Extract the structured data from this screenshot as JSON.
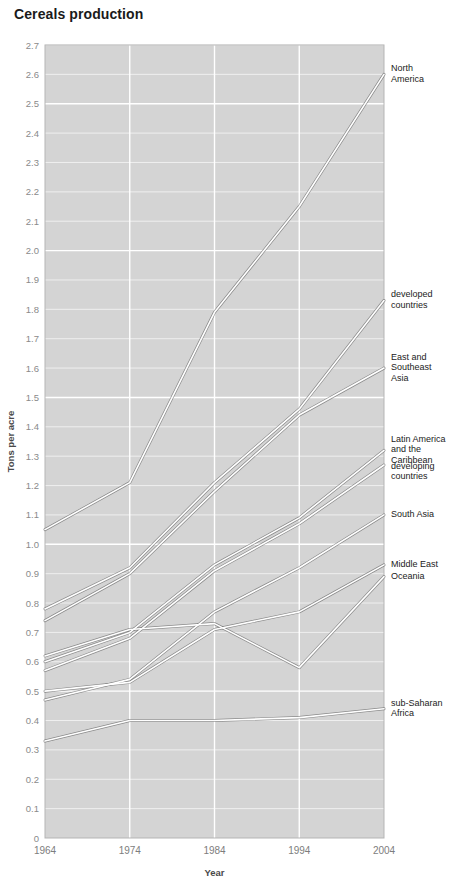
{
  "title": "Cereals production",
  "chart_data": {
    "type": "line",
    "title": "Cereals production",
    "xlabel": "Year",
    "ylabel": "Tons per acre",
    "x": [
      1964,
      1974,
      1984,
      1994,
      2004
    ],
    "xtick_labels": [
      "1964",
      "1974",
      "1984",
      "1994",
      "2004"
    ],
    "ylim": [
      0,
      2.7
    ],
    "ytick_labels": [
      "0",
      "0.1",
      "0.2",
      "0.3",
      "0.4",
      "0.5",
      "0.6",
      "0.7",
      "0.8",
      "0.9",
      "1.0",
      "1.1",
      "1.2",
      "1.3",
      "1.4",
      "1.5",
      "1.6",
      "1.7",
      "1.8",
      "1.9",
      "2.0",
      "2.1",
      "2.2",
      "2.3",
      "2.4",
      "2.5",
      "2.6",
      "2.7"
    ],
    "ytick_values": [
      0,
      0.1,
      0.2,
      0.3,
      0.4,
      0.5,
      0.6,
      0.7,
      0.8,
      0.9,
      1.0,
      1.1,
      1.2,
      1.3,
      1.4,
      1.5,
      1.6,
      1.7,
      1.8,
      1.9,
      2.0,
      2.1,
      2.2,
      2.3,
      2.4,
      2.5,
      2.6,
      2.7
    ],
    "grid": true,
    "legend_position": "right-inline-labels",
    "series": [
      {
        "name": "North America",
        "label": "North America",
        "values": [
          1.05,
          1.21,
          1.79,
          2.15,
          2.6
        ]
      },
      {
        "name": "developed countries",
        "label": "developed countries",
        "values": [
          0.78,
          0.92,
          1.21,
          1.46,
          1.83
        ]
      },
      {
        "name": "East and Southeast Asia",
        "label": "East and Southeast Asia",
        "values": [
          0.74,
          0.9,
          1.18,
          1.44,
          1.6
        ]
      },
      {
        "name": "Latin America and the Caribbean",
        "label": "Latin America and the Caribbean",
        "values": [
          0.6,
          0.7,
          0.93,
          1.09,
          1.32
        ]
      },
      {
        "name": "developing countries",
        "label": "developing countries",
        "values": [
          0.57,
          0.68,
          0.91,
          1.07,
          1.27
        ]
      },
      {
        "name": "South Asia",
        "label": "South Asia",
        "values": [
          0.47,
          0.54,
          0.77,
          0.92,
          1.1
        ]
      },
      {
        "name": "Middle East",
        "label": "Middle East",
        "values": [
          0.5,
          0.53,
          0.71,
          0.77,
          0.93
        ]
      },
      {
        "name": "Oceania",
        "label": "Oceania",
        "values": [
          0.62,
          0.71,
          0.73,
          0.58,
          0.89
        ]
      },
      {
        "name": "sub-Saharan Africa",
        "label": "sub-Saharan Africa",
        "values": [
          0.33,
          0.4,
          0.4,
          0.41,
          0.44
        ]
      }
    ]
  },
  "labels": {
    "north_america": "North\nAmerica",
    "developed": "developed\ncountries",
    "east_se_asia": "East and\nSoutheast\nAsia",
    "latin_america": "Latin America\nand the\nCaribbean",
    "developing": "developing\ncountries",
    "south_asia": "South Asia",
    "middle_east": "Middle East",
    "oceania": "Oceania",
    "subsaharan": "sub-Saharan\nAfrica"
  },
  "colors": {
    "plot_background": "#d4d4d4",
    "page_background": "#ffffff",
    "gridline": "#ffffff",
    "line_stroke": "#ffffff",
    "line_shadow": "#4f4f4f",
    "tick_text": "#8a8a8a",
    "title_text": "#1a1a1a"
  }
}
